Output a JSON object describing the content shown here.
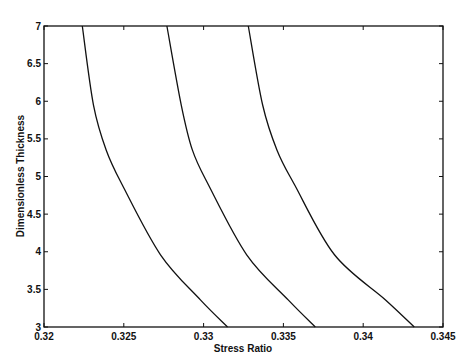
{
  "chart_data": {
    "type": "line",
    "title": "",
    "xlabel": "Stress Ratio",
    "ylabel": "Dimensionless Thickness",
    "xlim": [
      0.32,
      0.345
    ],
    "ylim": [
      3,
      7
    ],
    "xticks": [
      0.32,
      0.325,
      0.33,
      0.335,
      0.34,
      0.345
    ],
    "xtick_labels": [
      "0.32",
      "0.325",
      "0.33",
      "0.335",
      "0.34",
      "0.345"
    ],
    "yticks": [
      3,
      3.5,
      4,
      4.5,
      5,
      5.5,
      6,
      6.5,
      7
    ],
    "ytick_labels": [
      "3",
      "3.5",
      "4",
      "4.5",
      "5",
      "5.5",
      "6",
      "6.5",
      "7"
    ],
    "grid": false,
    "legend": null,
    "line_color": "#111111",
    "series": [
      {
        "name": "curve-1",
        "x": [
          0.3224,
          0.3231,
          0.3239,
          0.3249,
          0.3273,
          0.3298,
          0.3315
        ],
        "y": [
          7.0,
          5.95,
          5.35,
          4.89,
          3.96,
          3.36,
          3.0
        ]
      },
      {
        "name": "curve-2",
        "x": [
          0.3277,
          0.3286,
          0.3293,
          0.3303,
          0.3327,
          0.3353,
          0.337
        ],
        "y": [
          7.0,
          5.95,
          5.35,
          4.89,
          3.96,
          3.36,
          3.0
        ]
      },
      {
        "name": "curve-3",
        "x": [
          0.3328,
          0.3337,
          0.3346,
          0.3357,
          0.3382,
          0.3414,
          0.3432
        ],
        "y": [
          7.0,
          5.95,
          5.35,
          4.89,
          3.96,
          3.36,
          3.0
        ]
      }
    ]
  }
}
